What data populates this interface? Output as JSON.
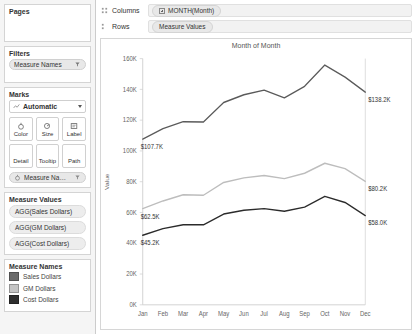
{
  "sidebar": {
    "pages": {
      "title": "Pages"
    },
    "filters": {
      "title": "Filters",
      "pill": {
        "label": "Measure Names",
        "icon": "filter-pill-icon"
      }
    },
    "marks": {
      "title": "Marks",
      "mark_type": "Automatic",
      "mark_type_icon": "line-mark-icon",
      "buttons": [
        {
          "label": "Color",
          "icon": "color-icon"
        },
        {
          "label": "Size",
          "icon": "size-icon"
        },
        {
          "label": "Label",
          "icon": "label-icon"
        },
        {
          "label": "Detail",
          "icon": "detail-icon"
        },
        {
          "label": "Tooltip",
          "icon": "tooltip-icon"
        },
        {
          "label": "Path",
          "icon": "path-icon"
        }
      ],
      "pill": {
        "label": "Measure Names",
        "icon": "color-pill-icon"
      }
    },
    "measure_values": {
      "title": "Measure Values",
      "items": [
        {
          "label": "AGG(Sales Dollars)"
        },
        {
          "label": "AGG(GM Dollars)"
        },
        {
          "label": "AGG(Cost Dollars)"
        }
      ]
    },
    "measure_names": {
      "title": "Measure Names",
      "items": [
        {
          "label": "Sales Dollars",
          "color": "#6b6b6b"
        },
        {
          "label": "GM Dollars",
          "color": "#c4c4c4"
        },
        {
          "label": "Cost Dollars",
          "color": "#2e2e2e"
        }
      ]
    }
  },
  "shelves": {
    "columns": {
      "name": "Columns",
      "pill": "MONTH(Month)",
      "icon": "columns-grip-icon",
      "expand": "plus-box-icon"
    },
    "rows": {
      "name": "Rows",
      "pill": "Measure Values",
      "icon": "rows-grip-icon"
    }
  },
  "chart_data": {
    "type": "line",
    "title": "Month of Month",
    "xlabel": "",
    "ylabel": "Value",
    "categories": [
      "Jan",
      "Feb",
      "Mar",
      "Apr",
      "May",
      "Jun",
      "Jul",
      "Aug",
      "Sep",
      "Oct",
      "Nov",
      "Dec"
    ],
    "ylim": [
      0,
      160000
    ],
    "yticks": [
      0,
      20000,
      40000,
      60000,
      80000,
      100000,
      120000,
      140000,
      160000
    ],
    "ytick_labels": [
      "0K",
      "20K",
      "40K",
      "60K",
      "80K",
      "100K",
      "120K",
      "140K",
      "160K"
    ],
    "grid": false,
    "legend_position": "sidebar",
    "series": [
      {
        "name": "Sales Dollars",
        "color": "#5a5a5a",
        "values": [
          107700,
          114500,
          119000,
          118800,
          131500,
          136500,
          139500,
          134500,
          142000,
          155800,
          148000,
          138200
        ],
        "start_label": "$107.7K",
        "end_label": "$138.2K"
      },
      {
        "name": "GM Dollars",
        "color": "#bdbdbd",
        "values": [
          62500,
          67500,
          71500,
          71200,
          79500,
          82500,
          84000,
          82000,
          85500,
          92000,
          88500,
          80200
        ],
        "start_label": "$62.5K",
        "end_label": "$80.2K"
      },
      {
        "name": "Cost Dollars",
        "color": "#2b2b2b",
        "values": [
          45200,
          49500,
          52000,
          52000,
          59000,
          61500,
          62500,
          60800,
          63500,
          70500,
          66500,
          58000
        ],
        "start_label": "$45.2K",
        "end_label": "$58.0K"
      }
    ],
    "annotations": [
      {
        "text": "$107.7K",
        "series": "Sales Dollars",
        "at": "Jan"
      },
      {
        "text": "$138.2K",
        "series": "Sales Dollars",
        "at": "Dec"
      },
      {
        "text": "$62.5K",
        "series": "GM Dollars",
        "at": "Jan"
      },
      {
        "text": "$80.2K",
        "series": "GM Dollars",
        "at": "Dec"
      },
      {
        "text": "$45.2K",
        "series": "Cost Dollars",
        "at": "Jan"
      },
      {
        "text": "$58.0K",
        "series": "Cost Dollars",
        "at": "Dec"
      }
    ]
  }
}
